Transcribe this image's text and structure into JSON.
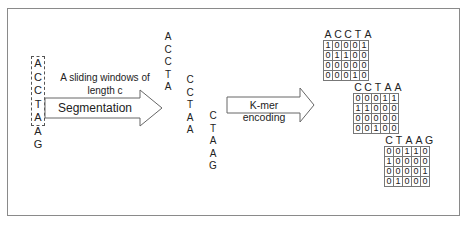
{
  "diagram": {
    "input_sequence": [
      "A",
      "C",
      "C",
      "T",
      "A",
      "A",
      "G"
    ],
    "window_label": "A sliding windows of length c",
    "window_label_line1": "A sliding windows of",
    "window_label_line2": "length c",
    "segmentation_label": "Segmentation",
    "kmer_label": "K-mer encoding",
    "segments": [
      {
        "letters": [
          "A",
          "C",
          "C",
          "T",
          "A"
        ]
      },
      {
        "letters": [
          "C",
          "C",
          "T",
          "A",
          "A"
        ]
      },
      {
        "letters": [
          "C",
          "T",
          "A",
          "A",
          "G"
        ]
      }
    ],
    "matrices": [
      {
        "header": [
          "A",
          "C",
          "C",
          "T",
          "A"
        ],
        "rows": [
          [
            "1",
            "0",
            "0",
            "0",
            "1"
          ],
          [
            "0",
            "1",
            "1",
            "0",
            "0"
          ],
          [
            "0",
            "0",
            "0",
            "0",
            "0"
          ],
          [
            "0",
            "0",
            "0",
            "1",
            "0"
          ]
        ]
      },
      {
        "header": [
          "C",
          "C",
          "T",
          "A",
          "A"
        ],
        "rows": [
          [
            "0",
            "0",
            "0",
            "1",
            "1"
          ],
          [
            "1",
            "1",
            "0",
            "0",
            "0"
          ],
          [
            "0",
            "0",
            "0",
            "0",
            "0"
          ],
          [
            "0",
            "0",
            "1",
            "0",
            "0"
          ]
        ]
      },
      {
        "header": [
          "C",
          "T",
          "A",
          "A",
          "G"
        ],
        "rows": [
          [
            "0",
            "0",
            "1",
            "1",
            "0"
          ],
          [
            "1",
            "0",
            "0",
            "0",
            "0"
          ],
          [
            "0",
            "0",
            "0",
            "0",
            "1"
          ],
          [
            "0",
            "1",
            "0",
            "0",
            "0"
          ]
        ]
      }
    ],
    "colors": {
      "border": "#8a8a8a",
      "arrow_stroke": "#666666",
      "text": "#222222"
    }
  }
}
